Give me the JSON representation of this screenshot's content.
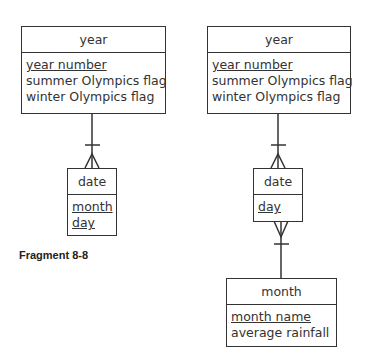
{
  "caption": "Fragment 8-8",
  "left": {
    "year": {
      "name": "year",
      "attributes": [
        {
          "label": "year number",
          "key": true
        },
        {
          "label": "summer Olympics flag",
          "key": false
        },
        {
          "label": "winter Olympics flag",
          "key": false
        }
      ]
    },
    "date": {
      "name": "date",
      "attributes": [
        {
          "label": "month",
          "key": true
        },
        {
          "label": "day",
          "key": true
        }
      ]
    },
    "relationships": [
      {
        "from": "year",
        "to": "date",
        "from_cardinality": "one",
        "to_cardinality": "many"
      }
    ]
  },
  "right": {
    "year": {
      "name": "year",
      "attributes": [
        {
          "label": "year number",
          "key": true
        },
        {
          "label": "summer Olympics flag",
          "key": false
        },
        {
          "label": "winter Olympics flag",
          "key": false
        }
      ]
    },
    "date": {
      "name": "date",
      "attributes": [
        {
          "label": "day",
          "key": true
        }
      ]
    },
    "month": {
      "name": "month",
      "attributes": [
        {
          "label": "month name",
          "key": true
        },
        {
          "label": "average rainfall",
          "key": false
        }
      ]
    },
    "relationships": [
      {
        "from": "year",
        "to": "date",
        "from_cardinality": "one",
        "to_cardinality": "many"
      },
      {
        "from": "month",
        "to": "date",
        "from_cardinality": "one",
        "to_cardinality": "many"
      }
    ]
  }
}
